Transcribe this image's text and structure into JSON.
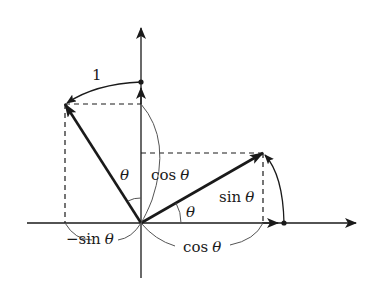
{
  "diagram": {
    "colors": {
      "stroke": "#1a1a1a",
      "thin_stroke": "#555555",
      "background": "#ffffff"
    },
    "labels": {
      "unit_length": "1",
      "theta_upper": "θ",
      "cos_upper_fn": "cos",
      "cos_upper_var": "θ",
      "sin_right_fn": "sin",
      "sin_right_var": "θ",
      "theta_lower": "θ",
      "neg_sin_fn": "−sin",
      "neg_sin_var": "θ",
      "cos_lower_fn": "cos",
      "cos_lower_var": "θ"
    },
    "points": {
      "origin": [
        141,
        223
      ],
      "rotated_e1_tip": [
        263,
        153
      ],
      "rotated_e2_tip": [
        65,
        104
      ],
      "e1_unit_dot": [
        284,
        223
      ],
      "e2_unit_dot": [
        141,
        82
      ]
    }
  }
}
